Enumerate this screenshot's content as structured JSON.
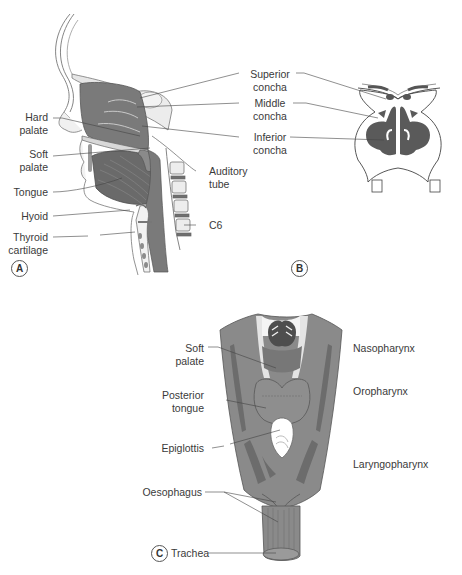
{
  "figure": {
    "panels": [
      {
        "id": "A",
        "view": "sagittal-head-neck",
        "labels_left": [
          "Hard\npalate",
          "Soft\npalate",
          "Tongue",
          "Hyoid",
          "Thyroid\ncartilage"
        ],
        "labels_right": [
          "Superior\nconcha",
          "Middle\nconcha",
          "Inferior\nconcha",
          "Auditory\ntube",
          "C6"
        ]
      },
      {
        "id": "B",
        "view": "coronal-nasal-cavity",
        "labels": [
          "Superior\nconcha",
          "Middle\nconcha",
          "Inferior\nconcha"
        ]
      },
      {
        "id": "C",
        "view": "posterior-pharynx",
        "labels_left": [
          "Soft\npalate",
          "Posterior\ntongue",
          "Epiglottis",
          "Oesophagus",
          "Trachea"
        ],
        "labels_right": [
          "Nasopharynx",
          "Oropharynx",
          "Laryngopharynx"
        ]
      }
    ],
    "panel_letters": {
      "a": "A",
      "b": "B",
      "c": "C"
    },
    "labels": {
      "hard_palate": "Hard\npalate",
      "soft_palate_a": "Soft\npalate",
      "tongue": "Tongue",
      "hyoid": "Hyoid",
      "thyroid_cartilage": "Thyroid\ncartilage",
      "superior_concha": "Superior\nconcha",
      "middle_concha": "Middle\nconcha",
      "inferior_concha": "Inferior\nconcha",
      "auditory_tube": "Auditory\ntube",
      "c6": "C6",
      "soft_palate_c": "Soft\npalate",
      "posterior_tongue": "Posterior\ntongue",
      "epiglottis": "Epiglottis",
      "oesophagus": "Oesophagus",
      "trachea": "Trachea",
      "nasopharynx": "Nasopharynx",
      "oropharynx": "Oropharynx",
      "laryngopharynx": "Laryngopharynx"
    },
    "colors": {
      "tissue_dark": "#6e6e6e",
      "tissue_mid": "#8c8c8c",
      "tissue_light": "#bdbdbd",
      "bone_fill": "#e8e8e8",
      "outline": "#555555",
      "leader": "#444444"
    }
  }
}
